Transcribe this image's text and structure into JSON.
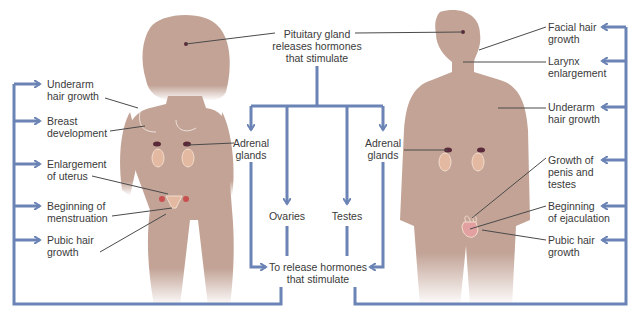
{
  "colors": {
    "silhouette": "#c2a396",
    "flow_line": "#6b83b5",
    "leader_line": "#4a4a4a",
    "organ_red": "#c8504f",
    "organ_dark": "#5a2a3a",
    "kidney_fill": "#e3b9a2",
    "text": "#3a3a3a",
    "background": "#ffffff"
  },
  "center": {
    "pituitary": [
      "Pituitary gland",
      "releases hormones",
      "that stimulate"
    ],
    "adrenal_left": [
      "Adrenal",
      "glands"
    ],
    "adrenal_right": [
      "Adrenal",
      "glands"
    ],
    "ovaries": "Ovaries",
    "testes": "Testes",
    "release": [
      "To release hormones",
      "that stimulate"
    ]
  },
  "female": {
    "labels": [
      [
        "Underarm",
        "hair growth"
      ],
      [
        "Breast",
        "development"
      ],
      [
        "Enlargement",
        "of uterus"
      ],
      [
        "Beginning of",
        "menstruation"
      ],
      [
        "Pubic hair",
        "growth"
      ]
    ]
  },
  "male": {
    "labels": [
      [
        "Facial hair",
        "growth"
      ],
      [
        "Larynx",
        "enlargement"
      ],
      [
        "Underarm",
        "hair growth"
      ],
      [
        "Growth of",
        "penis and",
        "testes"
      ],
      [
        "Beginning",
        "of ejaculation"
      ],
      [
        "Pubic hair",
        "growth"
      ]
    ]
  }
}
